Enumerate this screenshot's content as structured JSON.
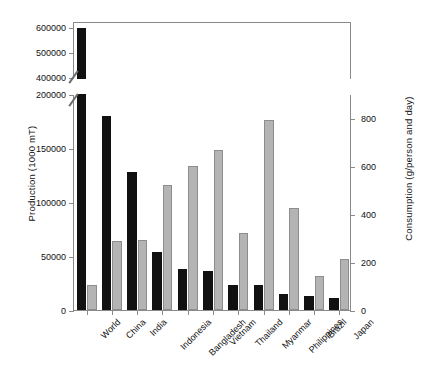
{
  "chart_data": {
    "type": "bar",
    "title": "",
    "xlabel": "",
    "ylabel": "Production (1000 mT)",
    "ylabel_secondary": "Consumption (g/person and day)",
    "categories": [
      "World",
      "China",
      "India",
      "Indonesia",
      "Bangladesh",
      "Vietnam",
      "Thailand",
      "Myanmar",
      "Philippines",
      "Brazil",
      "Japan"
    ],
    "series": [
      {
        "name": "Production (1000 mT)",
        "axis": "left",
        "color": "#111111",
        "values": [
          600000,
          180000,
          128000,
          54000,
          38000,
          36000,
          23500,
          23500,
          14500,
          13000,
          11000
        ]
      },
      {
        "name": "Consumption (g/person and day)",
        "axis": "right",
        "color": "#b4b4b4",
        "values": [
          105,
          288,
          290,
          520,
          600,
          668,
          322,
          790,
          425,
          143,
          213
        ]
      }
    ],
    "left_axis": {
      "lower_ticks": [
        0,
        50000,
        100000,
        150000,
        200000
      ],
      "upper_ticks": [
        400000,
        500000,
        600000
      ],
      "lower_range": [
        0,
        200000
      ],
      "upper_range": [
        390000,
        620000
      ],
      "axis_break": true
    },
    "right_axis": {
      "ticks": [
        0,
        200,
        400,
        600,
        800
      ],
      "range": [
        0,
        900
      ]
    },
    "grid": false,
    "legend": "none"
  }
}
